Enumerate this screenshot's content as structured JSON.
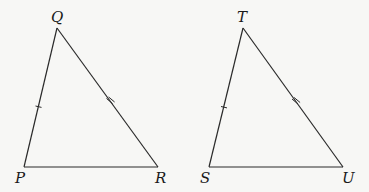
{
  "diagram": {
    "triangles": [
      {
        "name": "PQR",
        "vertices": [
          "P",
          "Q",
          "R"
        ],
        "marks": [
          {
            "side": "PQ",
            "ticks": 1
          },
          {
            "side": "QR",
            "ticks": 2
          },
          {
            "side": "PR",
            "ticks": 0
          }
        ]
      },
      {
        "name": "STU",
        "vertices": [
          "S",
          "T",
          "U"
        ],
        "marks": [
          {
            "side": "ST",
            "ticks": 1
          },
          {
            "side": "TU",
            "ticks": 2
          },
          {
            "side": "SU",
            "ticks": 0
          }
        ]
      }
    ],
    "labels": {
      "P": "P",
      "Q": "Q",
      "R": "R",
      "S": "S",
      "T": "T",
      "U": "U"
    }
  }
}
